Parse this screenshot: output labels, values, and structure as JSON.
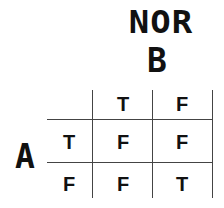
{
  "title": "NOR",
  "column_variable": "B",
  "row_variable": "A",
  "column_headers": [
    "T",
    "F"
  ],
  "rows": [
    {
      "header": "T",
      "values": [
        "F",
        "F"
      ]
    },
    {
      "header": "F",
      "values": [
        "F",
        "T"
      ]
    }
  ]
}
